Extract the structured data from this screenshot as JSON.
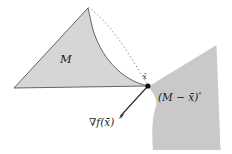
{
  "figure": {
    "type": "geometric-diagram",
    "caption_absent": true,
    "background_color": "#ffffff",
    "region_fill_color": "#d4d4d4",
    "region_stroke_color": "#4a4a4a",
    "plane_fill_color": "#c9c9c9",
    "line_color": "#2b2b2b",
    "dotted_color": "#8a8a8a",
    "labels": {
      "set_M": "M",
      "point_xbar": "x̄",
      "polar_cone": "(M − x̄)°",
      "polar_cone_base": "(M − x̄)",
      "polar_cone_degree": "°",
      "gradient": "∇f(x̄)"
    },
    "elements": [
      {
        "name": "convex-set-region",
        "label": "M",
        "description": "shaded curved-triangular convex set"
      },
      {
        "name": "polar-cone-plane",
        "label": "(M − x̄)°",
        "description": "shaded quadrilateral plane representing the polar cone"
      },
      {
        "name": "boundary-point",
        "label": "x̄",
        "description": "black dot at the right vertex of M"
      },
      {
        "name": "gradient-arrow",
        "label": "∇f(x̄)",
        "description": "arrow from x̄ pointing down-left"
      },
      {
        "name": "dotted-chord",
        "description": "dotted line from apex of M to x̄"
      }
    ],
    "geometry": {
      "apex": [
        88,
        8
      ],
      "left_vertex": [
        14,
        88
      ],
      "right_vertex": [
        148,
        86
      ],
      "gradient_arrow_tip": [
        118,
        119
      ]
    }
  }
}
